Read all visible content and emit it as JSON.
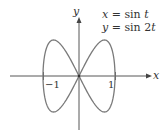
{
  "chart_data": {
    "type": "line",
    "title": "",
    "equations": [
      "x = sin t",
      "y = sin 2t"
    ],
    "xlabel": "x",
    "ylabel": "y",
    "xticks": [
      {
        "value": -1,
        "label": "−1"
      },
      {
        "value": 1,
        "label": "1"
      }
    ],
    "xlim": [
      -1.9,
      1.95
    ],
    "ylim": [
      -1.5,
      1.7
    ],
    "grid": false,
    "legend": null,
    "series": [
      {
        "name": "x = sin t, y = sin 2t",
        "parametric": true,
        "t_range": [
          0,
          6.2832
        ],
        "points": [
          {
            "x": 0,
            "y": 0
          },
          {
            "x": 0.707,
            "y": 1
          },
          {
            "x": 1,
            "y": 0
          },
          {
            "x": 0.707,
            "y": -1
          },
          {
            "x": 0,
            "y": 0
          },
          {
            "x": -0.707,
            "y": 1
          },
          {
            "x": -1,
            "y": 0
          },
          {
            "x": -0.707,
            "y": -1
          },
          {
            "x": 0,
            "y": 0
          }
        ],
        "color": "#7a7a7a"
      }
    ]
  },
  "labels": {
    "eq1_lhs": "x",
    "eq1_rhs": " = sin ",
    "eq1_var": "t",
    "eq2_lhs": "y",
    "eq2_rhs": " = sin 2",
    "eq2_var": "t",
    "x_axis": "x",
    "y_axis": "y",
    "tick_neg1": "−1",
    "tick_pos1": "1"
  },
  "colors": {
    "axis": "#444444",
    "curve": "#7a7a7a",
    "text": "#333333"
  }
}
